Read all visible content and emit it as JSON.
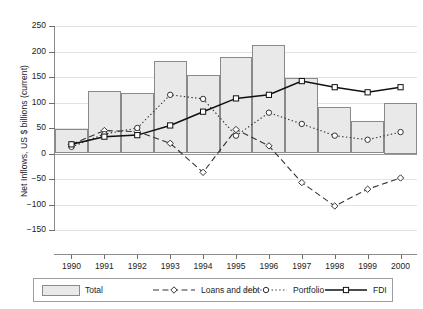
{
  "chart_data": {
    "type": "bar",
    "title": "",
    "xlabel": "",
    "ylabel": "Net Inflows, US $ billions (current)",
    "categories": [
      "1990",
      "1991",
      "1992",
      "1993",
      "1994",
      "1995",
      "1996",
      "1997",
      "1998",
      "1999",
      "2000"
    ],
    "ylim": [
      -150,
      250
    ],
    "yticks": [
      250,
      200,
      150,
      100,
      50,
      0,
      -50,
      -100,
      -150
    ],
    "ytick_labels": [
      "250",
      "200",
      "150",
      "100",
      "50",
      "0",
      "−50",
      "−100",
      "−150"
    ],
    "grid": true,
    "legend_position": "bottom",
    "series": [
      {
        "name": "Total",
        "kind": "bar",
        "fill": "#e9e9e9",
        "stroke": "#8a8a8a",
        "values": [
          48,
          122,
          119,
          182,
          153,
          190,
          213,
          148,
          92,
          63,
          100
        ]
      },
      {
        "name": "Loans and debt",
        "kind": "line",
        "style": "dashed",
        "marker": "diamond",
        "stroke": "#333333",
        "values": [
          18,
          45,
          43,
          20,
          -37,
          47,
          15,
          -57,
          -103,
          -70,
          -48
        ]
      },
      {
        "name": "Portfolio",
        "kind": "line",
        "style": "dotted",
        "marker": "circle",
        "stroke": "#333333",
        "values": [
          13,
          38,
          50,
          115,
          107,
          35,
          80,
          58,
          35,
          27,
          42
        ]
      },
      {
        "name": "FDI",
        "kind": "line",
        "style": "solid",
        "marker": "square",
        "stroke": "#111111",
        "values": [
          18,
          33,
          36,
          55,
          82,
          108,
          115,
          142,
          130,
          120,
          130
        ]
      }
    ]
  },
  "legend": {
    "items": [
      {
        "label": "Total"
      },
      {
        "label": "Loans and debt"
      },
      {
        "label": "Portfolio"
      },
      {
        "label": "FDI"
      }
    ]
  }
}
